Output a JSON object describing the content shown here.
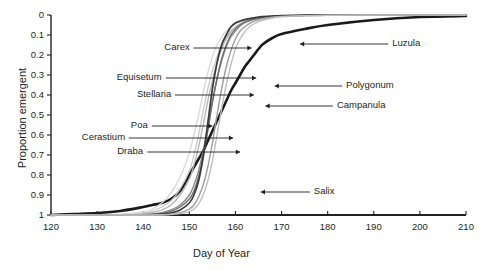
{
  "figure": {
    "title": "",
    "x_axis_title": "Day of Year",
    "y_axis_title": "Proportion emergent"
  },
  "axes": {
    "x_ticks": [
      "120",
      "130",
      "140",
      "150",
      "160",
      "170",
      "180",
      "190",
      "200",
      "210"
    ],
    "y_ticks": [
      "1",
      "0.9",
      "0.8",
      "0.7",
      "0.6",
      "0.5",
      "0.4",
      "0.3",
      "0.2",
      "0.1",
      "0"
    ]
  },
  "labels": {
    "carex": "Carex",
    "equisetum": "Equisetum",
    "stellaria": "Stellaria",
    "poa": "Poa",
    "cerastium": "Cerastium",
    "draba": "Draba",
    "salix": "Salix",
    "luzula": "Luzula",
    "polygonum": "Polygonum",
    "campanula": "Campanula"
  },
  "chart_data": {
    "type": "line",
    "title": "",
    "xlabel": "Day of Year",
    "ylabel": "Proportion emergent",
    "xlim": [
      120,
      210
    ],
    "ylim": [
      0,
      1
    ],
    "xticks": [
      120,
      130,
      140,
      150,
      160,
      170,
      180,
      190,
      200,
      210
    ],
    "yticks": [
      0,
      0.1,
      0.2,
      0.3,
      0.4,
      0.5,
      0.6,
      0.7,
      0.8,
      0.9,
      1
    ],
    "grid": false,
    "legend": "annotated-arrows",
    "x": [
      120,
      125,
      130,
      135,
      140,
      142,
      144,
      146,
      148,
      150,
      151,
      152,
      153,
      154,
      155,
      156,
      157,
      158,
      159,
      160,
      161,
      162,
      163,
      164,
      165,
      166,
      168,
      170,
      175,
      180,
      190,
      200,
      210
    ],
    "series": [
      {
        "name": "Salix",
        "color": "#1a1a1a",
        "width": 2.6,
        "values": [
          0,
          0.005,
          0.01,
          0.02,
          0.04,
          0.05,
          0.06,
          0.08,
          0.12,
          0.2,
          0.24,
          0.28,
          0.32,
          0.37,
          0.42,
          0.47,
          0.52,
          0.57,
          0.62,
          0.66,
          0.7,
          0.74,
          0.77,
          0.8,
          0.83,
          0.855,
          0.885,
          0.905,
          0.93,
          0.95,
          0.975,
          0.99,
          0.995
        ]
      },
      {
        "name": "Draba",
        "color": "#c9c9c9",
        "width": 1.3,
        "values": [
          0,
          0,
          0,
          0.002,
          0.01,
          0.02,
          0.04,
          0.07,
          0.13,
          0.22,
          0.3,
          0.4,
          0.52,
          0.63,
          0.72,
          0.79,
          0.85,
          0.89,
          0.92,
          0.94,
          0.955,
          0.965,
          0.972,
          0.978,
          0.982,
          0.986,
          0.99,
          0.993,
          0.996,
          0.998,
          1,
          1,
          1
        ]
      },
      {
        "name": "Cerastium",
        "color": "#b5b5b5",
        "width": 1.3,
        "values": [
          0,
          0,
          0,
          0.001,
          0.006,
          0.012,
          0.025,
          0.05,
          0.1,
          0.18,
          0.25,
          0.34,
          0.45,
          0.57,
          0.67,
          0.76,
          0.83,
          0.88,
          0.915,
          0.94,
          0.955,
          0.965,
          0.973,
          0.979,
          0.984,
          0.988,
          0.992,
          0.995,
          0.998,
          0.999,
          1,
          1,
          1
        ]
      },
      {
        "name": "Poa",
        "color": "#d8d8d8",
        "width": 1.3,
        "values": [
          0,
          0,
          0,
          0.003,
          0.015,
          0.03,
          0.06,
          0.11,
          0.19,
          0.31,
          0.4,
          0.5,
          0.61,
          0.71,
          0.79,
          0.85,
          0.89,
          0.92,
          0.94,
          0.955,
          0.965,
          0.973,
          0.979,
          0.984,
          0.988,
          0.991,
          0.995,
          0.997,
          0.999,
          1,
          1,
          1,
          1
        ]
      },
      {
        "name": "Stellaria",
        "color": "#8c8c8c",
        "width": 1.4,
        "values": [
          0,
          0,
          0,
          0,
          0.002,
          0.005,
          0.012,
          0.025,
          0.05,
          0.1,
          0.15,
          0.22,
          0.32,
          0.44,
          0.57,
          0.68,
          0.77,
          0.84,
          0.89,
          0.92,
          0.945,
          0.96,
          0.97,
          0.978,
          0.983,
          0.987,
          0.992,
          0.995,
          0.998,
          0.999,
          1,
          1,
          1
        ]
      },
      {
        "name": "Equisetum",
        "color": "#6e6e6e",
        "width": 1.4,
        "values": [
          0,
          0,
          0,
          0,
          0.001,
          0.003,
          0.008,
          0.018,
          0.04,
          0.08,
          0.12,
          0.19,
          0.29,
          0.42,
          0.56,
          0.68,
          0.78,
          0.85,
          0.9,
          0.93,
          0.95,
          0.965,
          0.974,
          0.98,
          0.985,
          0.989,
          0.993,
          0.996,
          0.998,
          0.999,
          1,
          1,
          1
        ]
      },
      {
        "name": "Carex",
        "color": "#3a3a3a",
        "width": 1.7,
        "values": [
          0,
          0,
          0,
          0,
          0,
          0.001,
          0.004,
          0.01,
          0.025,
          0.06,
          0.1,
          0.17,
          0.29,
          0.46,
          0.63,
          0.76,
          0.85,
          0.9,
          0.94,
          0.96,
          0.97,
          0.977,
          0.982,
          0.986,
          0.99,
          0.992,
          0.995,
          0.997,
          0.999,
          1,
          1,
          1,
          1
        ]
      },
      {
        "name": "Campanula",
        "color": "#9e9e9e",
        "width": 1.4,
        "values": [
          0,
          0,
          0,
          0,
          0,
          0,
          0.001,
          0.004,
          0.012,
          0.03,
          0.05,
          0.09,
          0.15,
          0.24,
          0.36,
          0.5,
          0.63,
          0.74,
          0.82,
          0.88,
          0.92,
          0.94,
          0.957,
          0.968,
          0.976,
          0.982,
          0.989,
          0.993,
          0.997,
          0.999,
          1,
          1,
          1
        ]
      },
      {
        "name": "Polygonum",
        "color": "#bfbfbf",
        "width": 1.4,
        "values": [
          0,
          0,
          0,
          0,
          0,
          0,
          0,
          0.002,
          0.007,
          0.018,
          0.03,
          0.055,
          0.1,
          0.17,
          0.27,
          0.4,
          0.53,
          0.65,
          0.75,
          0.83,
          0.88,
          0.915,
          0.94,
          0.955,
          0.967,
          0.975,
          0.985,
          0.991,
          0.996,
          0.998,
          1,
          1,
          1
        ]
      }
    ],
    "annotations": [
      {
        "label": "Carex",
        "text_x": 150,
        "text_y": 0.835,
        "arrow_to_x": 163.5,
        "arrow_to_y": 0.835
      },
      {
        "label": "Equisetum",
        "text_x": 144,
        "text_y": 0.685,
        "arrow_to_x": 164.5,
        "arrow_to_y": 0.685
      },
      {
        "label": "Stellaria",
        "text_x": 146,
        "text_y": 0.6,
        "arrow_to_x": 164,
        "arrow_to_y": 0.6
      },
      {
        "label": "Poa",
        "text_x": 141,
        "text_y": 0.445,
        "arrow_to_x": 155,
        "arrow_to_y": 0.445
      },
      {
        "label": "Cerastium",
        "text_x": 136,
        "text_y": 0.385,
        "arrow_to_x": 159.5,
        "arrow_to_y": 0.385
      },
      {
        "label": "Draba",
        "text_x": 140,
        "text_y": 0.315,
        "arrow_to_x": 161,
        "arrow_to_y": 0.315
      },
      {
        "label": "Salix",
        "text_x": 177,
        "text_y": 0.115,
        "arrow_to_x": 165.5,
        "arrow_to_y": 0.115
      },
      {
        "label": "Luzula",
        "text_x": 194,
        "text_y": 0.855,
        "arrow_to_x": 174,
        "arrow_to_y": 0.855
      },
      {
        "label": "Polygonum",
        "text_x": 184,
        "text_y": 0.645,
        "arrow_to_x": 168.5,
        "arrow_to_y": 0.645
      },
      {
        "label": "Campanula",
        "text_x": 182,
        "text_y": 0.545,
        "arrow_to_x": 166.5,
        "arrow_to_y": 0.545
      }
    ]
  }
}
